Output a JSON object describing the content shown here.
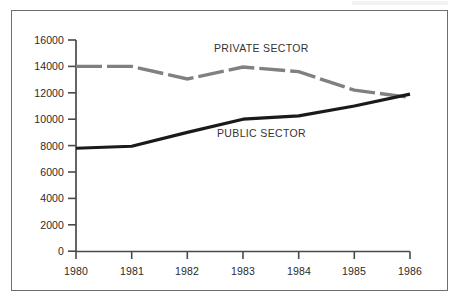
{
  "chart_data": {
    "type": "line",
    "title": "",
    "subtitle": "",
    "xlabel": "",
    "ylabel": "",
    "categories": [
      "1980",
      "1981",
      "1982",
      "1983",
      "1984",
      "1985",
      "1986"
    ],
    "x": [
      1980,
      1981,
      1982,
      1983,
      1984,
      1985,
      1986
    ],
    "xlim": [
      1980,
      1986
    ],
    "ylim": [
      0,
      16000
    ],
    "y_ticks": [
      0,
      2000,
      4000,
      6000,
      8000,
      10000,
      12000,
      14000,
      16000
    ],
    "y_tick_labels": [
      "0",
      "2000",
      "4000",
      "6000",
      "8000",
      "10000",
      "12000",
      "14000",
      "16000"
    ],
    "x_ticks": [
      1980,
      1981,
      1982,
      1983,
      1984,
      1985,
      1986
    ],
    "x_tick_labels": [
      "1980",
      "1981",
      "1982",
      "1983",
      "1984",
      "1985",
      "1986"
    ],
    "grid": false,
    "legend": "inline-annotations",
    "series": [
      {
        "name": "PRIVATE SECTOR",
        "color": "#808080",
        "style": "dashed",
        "width": 3.4,
        "values": [
          14000,
          14000,
          13050,
          13950,
          13600,
          12200,
          11650
        ]
      },
      {
        "name": "PUBLIC SECTOR",
        "color": "#1a1a1a",
        "style": "solid",
        "width": 3.2,
        "values": [
          7800,
          7950,
          9000,
          10000,
          10250,
          11000,
          11900
        ]
      }
    ],
    "annotations": [
      {
        "text": "PRIVATE SECTOR",
        "x": 1983.0,
        "y": 15100
      },
      {
        "text": "PUBLIC SECTOR",
        "x": 1983.3,
        "y": 9150
      }
    ]
  },
  "axes": {
    "y_labels": [
      "16000",
      "14000",
      "12000",
      "10000",
      "8000",
      "6000",
      "4000",
      "2000",
      "0"
    ],
    "x_labels": [
      "1980",
      "1981",
      "1982",
      "1983",
      "1984",
      "1985",
      "1986"
    ]
  },
  "annotations": {
    "private_sector_label": "PRIVATE SECTOR",
    "public_sector_label": "PUBLIC SECTOR"
  },
  "colors": {
    "private_line": "#808080",
    "public_line": "#1a1a1a",
    "axis": "#4a4a4a",
    "frame": "#6e6e6e",
    "text": "#2a2a2a",
    "background": "#ffffff"
  }
}
